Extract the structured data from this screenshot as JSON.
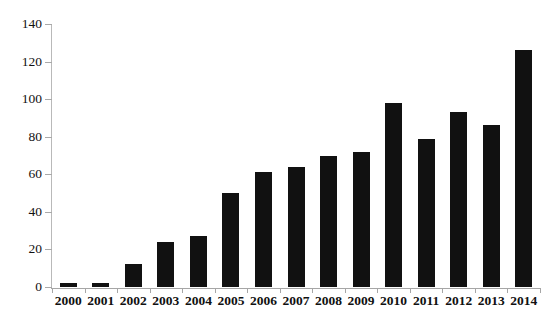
{
  "chart_data": {
    "type": "bar",
    "title": "",
    "xlabel": "",
    "ylabel": "",
    "categories": [
      "2000",
      "2001",
      "2002",
      "2003",
      "2004",
      "2005",
      "2006",
      "2007",
      "2008",
      "2009",
      "2010",
      "2011",
      "2012",
      "2013",
      "2014"
    ],
    "values": [
      2,
      2,
      12,
      24,
      27,
      50,
      61,
      64,
      70,
      72,
      98,
      79,
      93,
      86,
      126
    ],
    "ylim": [
      0,
      140
    ],
    "yticks": [
      0,
      20,
      40,
      60,
      80,
      100,
      120,
      140
    ],
    "ytick_labels": [
      "0",
      "20",
      "40",
      "60",
      "80",
      "100",
      "120",
      "140"
    ],
    "grid": false,
    "legend": false,
    "series": [
      {
        "name": "",
        "values": [
          2,
          2,
          12,
          24,
          27,
          50,
          61,
          64,
          70,
          72,
          98,
          79,
          93,
          86,
          126
        ]
      }
    ],
    "bar_color": "#111111",
    "background_color": "#ffffff",
    "axis_color": "#a6a6a6"
  }
}
